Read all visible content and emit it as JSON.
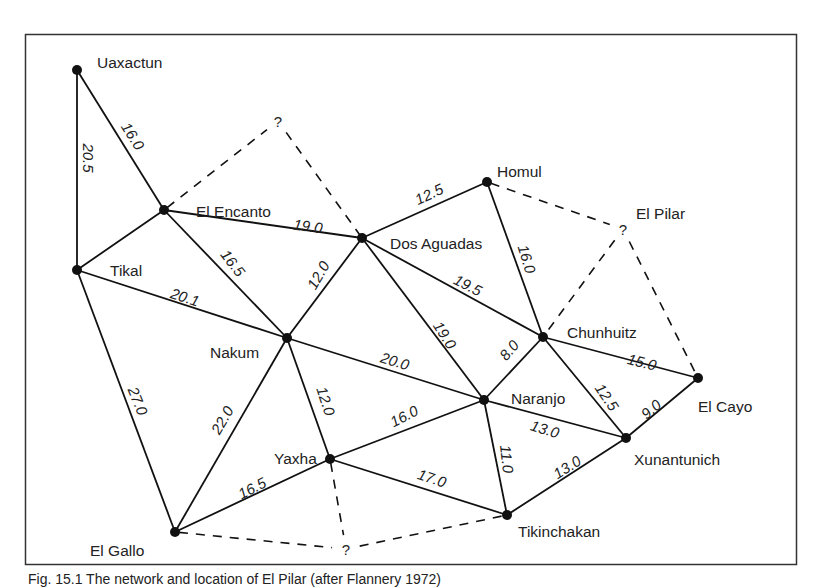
{
  "diagram": {
    "nodes": [
      {
        "id": "uaxactun",
        "label": "Uaxactun",
        "x": 77,
        "y": 70,
        "lx": 97,
        "ly": 62
      },
      {
        "id": "el-encanto",
        "label": "El Encanto",
        "x": 164,
        "y": 210,
        "lx": 196,
        "ly": 211
      },
      {
        "id": "tikal",
        "label": "Tikal",
        "x": 77,
        "y": 270,
        "lx": 110,
        "ly": 270
      },
      {
        "id": "dos-aguadas",
        "label": "Dos Aguadas",
        "x": 362,
        "y": 238,
        "lx": 390,
        "ly": 243
      },
      {
        "id": "homul",
        "label": "Homul",
        "x": 487,
        "y": 182,
        "lx": 497,
        "ly": 171
      },
      {
        "id": "nakum",
        "label": "Nakum",
        "x": 287,
        "y": 338,
        "lx": 210,
        "ly": 352
      },
      {
        "id": "chunhuitz",
        "label": "Chunhuitz",
        "x": 543,
        "y": 337,
        "lx": 567,
        "ly": 332
      },
      {
        "id": "el-cayo",
        "label": "El Cayo",
        "x": 698,
        "y": 378,
        "lx": 698,
        "ly": 406
      },
      {
        "id": "naranjo",
        "label": "Naranjo",
        "x": 484,
        "y": 400,
        "lx": 511,
        "ly": 398
      },
      {
        "id": "xunantunich",
        "label": "Xunantunich",
        "x": 626,
        "y": 438,
        "lx": 634,
        "ly": 459
      },
      {
        "id": "yaxha",
        "label": "Yaxha",
        "x": 330,
        "y": 459,
        "lx": 274,
        "ly": 458
      },
      {
        "id": "el-gallo",
        "label": "El Gallo",
        "x": 175,
        "y": 532,
        "lx": 90,
        "ly": 550
      },
      {
        "id": "tikinchakan",
        "label": "Tikinchakan",
        "x": 507,
        "y": 515,
        "lx": 518,
        "ly": 531
      }
    ],
    "unknown_nodes": [
      {
        "id": "q-north",
        "label": "?",
        "x": 278,
        "y": 121
      },
      {
        "id": "q-el-pilar",
        "label": "?",
        "x": 623,
        "y": 229,
        "name_label": "El Pilar",
        "nlx": 636,
        "nly": 213
      },
      {
        "id": "q-south",
        "label": "?",
        "x": 346,
        "y": 549
      }
    ],
    "edges": [
      {
        "from": "uaxactun",
        "to": "tikal",
        "value": "20.5"
      },
      {
        "from": "uaxactun",
        "to": "el-encanto",
        "value": "16.0"
      },
      {
        "from": "el-encanto",
        "to": "tikal",
        "value": ""
      },
      {
        "from": "el-encanto",
        "to": "dos-aguadas",
        "value": "19.0"
      },
      {
        "from": "el-encanto",
        "to": "nakum",
        "value": "16.5"
      },
      {
        "from": "tikal",
        "to": "nakum",
        "value": "20.1"
      },
      {
        "from": "tikal",
        "to": "el-gallo",
        "value": "27.0"
      },
      {
        "from": "dos-aguadas",
        "to": "homul",
        "value": "12.5"
      },
      {
        "from": "dos-aguadas",
        "to": "nakum",
        "value": "12.0"
      },
      {
        "from": "dos-aguadas",
        "to": "chunhuitz",
        "value": "19.5"
      },
      {
        "from": "dos-aguadas",
        "to": "naranjo",
        "value": "19.0"
      },
      {
        "from": "homul",
        "to": "chunhuitz",
        "value": "16.0"
      },
      {
        "from": "nakum",
        "to": "naranjo",
        "value": "20.0"
      },
      {
        "from": "nakum",
        "to": "yaxha",
        "value": "12.0"
      },
      {
        "from": "nakum",
        "to": "el-gallo",
        "value": "22.0"
      },
      {
        "from": "chunhuitz",
        "to": "naranjo",
        "value": "8.0"
      },
      {
        "from": "chunhuitz",
        "to": "el-cayo",
        "value": "15.0"
      },
      {
        "from": "chunhuitz",
        "to": "xunantunich",
        "value": "12.5"
      },
      {
        "from": "el-cayo",
        "to": "xunantunich",
        "value": "9.0"
      },
      {
        "from": "naranjo",
        "to": "xunantunich",
        "value": "13.0"
      },
      {
        "from": "naranjo",
        "to": "yaxha",
        "value": "16.0"
      },
      {
        "from": "naranjo",
        "to": "tikinchakan",
        "value": "11.0"
      },
      {
        "from": "xunantunich",
        "to": "tikinchakan",
        "value": "13.0"
      },
      {
        "from": "yaxha",
        "to": "el-gallo",
        "value": "16.5"
      },
      {
        "from": "yaxha",
        "to": "tikinchakan",
        "value": "17.0"
      }
    ],
    "dashed_edges": [
      {
        "from": "el-encanto",
        "to": "q-north"
      },
      {
        "from": "q-north",
        "to": "dos-aguadas"
      },
      {
        "from": "homul",
        "to": "q-el-pilar"
      },
      {
        "from": "q-el-pilar",
        "to": "chunhuitz"
      },
      {
        "from": "q-el-pilar",
        "to": "el-cayo"
      },
      {
        "from": "yaxha",
        "to": "q-south"
      },
      {
        "from": "el-gallo",
        "to": "q-south"
      },
      {
        "from": "q-south",
        "to": "tikinchakan"
      }
    ],
    "edge_labels": [
      {
        "text": "20.5",
        "x": 88,
        "y": 158,
        "rot": 90
      },
      {
        "text": "16.0",
        "x": 133,
        "y": 136,
        "rot": 58
      },
      {
        "text": "19.0",
        "x": 308,
        "y": 226,
        "rot": 8
      },
      {
        "text": "16.5",
        "x": 233,
        "y": 263,
        "rot": 52
      },
      {
        "text": "20.1",
        "x": 185,
        "y": 297,
        "rot": 18
      },
      {
        "text": "12.0",
        "x": 318,
        "y": 275,
        "rot": -60
      },
      {
        "text": "12.5",
        "x": 429,
        "y": 194,
        "rot": -25
      },
      {
        "text": "19.5",
        "x": 468,
        "y": 285,
        "rot": 27
      },
      {
        "text": "16.0",
        "x": 527,
        "y": 259,
        "rot": 73
      },
      {
        "text": "19.0",
        "x": 445,
        "y": 335,
        "rot": 58
      },
      {
        "text": "20.0",
        "x": 395,
        "y": 361,
        "rot": 17
      },
      {
        "text": "8.0",
        "x": 509,
        "y": 350,
        "rot": -50
      },
      {
        "text": "15.0",
        "x": 642,
        "y": 362,
        "rot": 14
      },
      {
        "text": "12.5",
        "x": 607,
        "y": 397,
        "rot": 56
      },
      {
        "text": "9.0",
        "x": 651,
        "y": 409,
        "rot": -40
      },
      {
        "text": "13.0",
        "x": 545,
        "y": 429,
        "rot": 17
      },
      {
        "text": "11.0",
        "x": 507,
        "y": 459,
        "rot": 84
      },
      {
        "text": "13.0",
        "x": 567,
        "y": 467,
        "rot": -32
      },
      {
        "text": "27.0",
        "x": 138,
        "y": 401,
        "rot": 68
      },
      {
        "text": "22.0",
        "x": 222,
        "y": 420,
        "rot": -60
      },
      {
        "text": "12.0",
        "x": 326,
        "y": 401,
        "rot": 72
      },
      {
        "text": "16.0",
        "x": 404,
        "y": 416,
        "rot": -27
      },
      {
        "text": "16.5",
        "x": 252,
        "y": 488,
        "rot": -27
      },
      {
        "text": "17.0",
        "x": 432,
        "y": 478,
        "rot": 18
      }
    ]
  },
  "caption": "Fig. 15.1 The network and location of El Pilar (after Flannery 1972)",
  "colors": {
    "line": "#111111",
    "text": "#222222",
    "frame": "#333333",
    "background": "#ffffff"
  }
}
